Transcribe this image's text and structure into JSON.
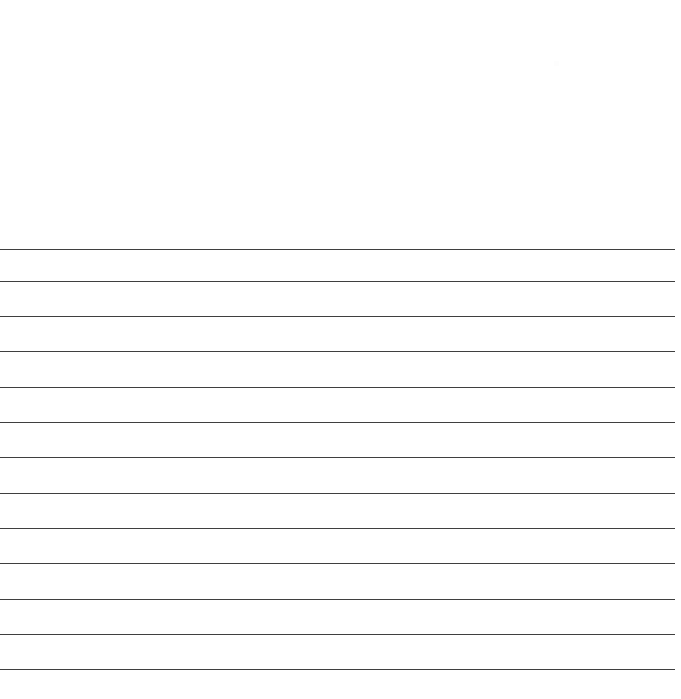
{
  "page": {
    "width": 681,
    "height": 699,
    "background_color": "#ffffff",
    "kind": "blank-ruled-paper"
  },
  "header_area": {
    "label": "blank writing area",
    "top": 0,
    "height": 240,
    "content": ""
  },
  "footer_area": {
    "label": "blank bottom margin",
    "height": 28,
    "content": ""
  },
  "rules": {
    "label": "horizontal ruled lines",
    "count": 13,
    "color": "#3f3f3f",
    "thickness_px": 1.6,
    "left_px": 0,
    "right_inset_px": 6,
    "y_positions": [
      249,
      281,
      316,
      351,
      387,
      422,
      457,
      493,
      528,
      563,
      599,
      634,
      669
    ]
  },
  "artifact": {
    "label": "faint speck",
    "x": 554,
    "y": 61,
    "width": 5,
    "height": 5,
    "color": "#fdfdfd"
  }
}
